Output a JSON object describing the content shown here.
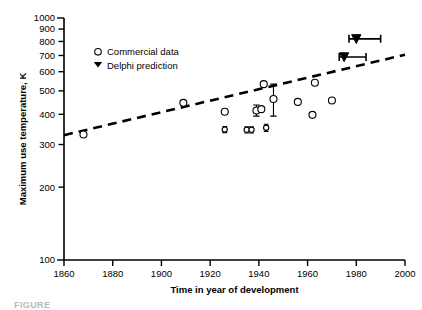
{
  "chart_data": {
    "type": "scatter",
    "title": "",
    "xlabel": "Time in year of development",
    "ylabel": "Maximum use temperature, K",
    "xlim": [
      1860,
      2000
    ],
    "ylim": [
      100,
      1000
    ],
    "yscale": "log",
    "xscale": "linear",
    "grid": false,
    "xticks": [
      1860,
      1880,
      1900,
      1920,
      1940,
      1960,
      1980,
      2000
    ],
    "xtick_labels": [
      "1860",
      "1880",
      "1900",
      "1920",
      "1940",
      "1960",
      "1980",
      "2000"
    ],
    "yticks": [
      100,
      200,
      300,
      400,
      500,
      600,
      700,
      800,
      900,
      1000
    ],
    "ytick_labels": [
      "100",
      "200",
      "300",
      "400",
      "500",
      "600",
      "700",
      "800",
      "900",
      "1000"
    ],
    "legend_position": "upper left",
    "legend": [
      {
        "label": "Commercial data",
        "marker": "open-circle"
      },
      {
        "label": "Delphi prediction",
        "marker": "filled-down-triangle"
      }
    ],
    "series": [
      {
        "name": "Commercial data",
        "marker": "open-circle",
        "points": [
          {
            "x": 1868,
            "y": 330,
            "yerr": 0,
            "size": "small"
          },
          {
            "x": 1909,
            "y": 446,
            "yerr": 0,
            "size": "small"
          },
          {
            "x": 1926,
            "y": 410,
            "yerr": 0,
            "size": "small"
          },
          {
            "x": 1926,
            "y": 346,
            "yerr": 10,
            "size": "tiny"
          },
          {
            "x": 1935,
            "y": 345,
            "yerr": 10,
            "size": "tiny"
          },
          {
            "x": 1937,
            "y": 345,
            "yerr": 10,
            "size": "tiny"
          },
          {
            "x": 1939,
            "y": 415,
            "yerr": 22,
            "size": "small"
          },
          {
            "x": 1941,
            "y": 420,
            "yerr": 0,
            "size": "small"
          },
          {
            "x": 1942,
            "y": 533,
            "yerr": 0,
            "size": "small"
          },
          {
            "x": 1943,
            "y": 352,
            "yerr": 12,
            "size": "tiny"
          },
          {
            "x": 1946,
            "y": 463,
            "yerr": 70,
            "size": "small"
          },
          {
            "x": 1956,
            "y": 450,
            "yerr": 0,
            "size": "small"
          },
          {
            "x": 1962,
            "y": 398,
            "yerr": 0,
            "size": "small"
          },
          {
            "x": 1963,
            "y": 540,
            "yerr": 0,
            "size": "small"
          },
          {
            "x": 1970,
            "y": 456,
            "yerr": 0,
            "size": "small"
          }
        ]
      },
      {
        "name": "Delphi prediction",
        "marker": "filled-down-triangle",
        "points": [
          {
            "x": 1980,
            "y": 820,
            "xerr_low": 1977,
            "xerr_high": 1990
          },
          {
            "x": 1975,
            "y": 690,
            "xerr_low": 1973,
            "xerr_high": 1984
          }
        ]
      }
    ],
    "trendline": {
      "style": "dashed",
      "x_start": 1860,
      "y_start": 328,
      "x_end": 2000,
      "y_end": 705
    }
  },
  "caption": {
    "text": "FIGURE"
  }
}
